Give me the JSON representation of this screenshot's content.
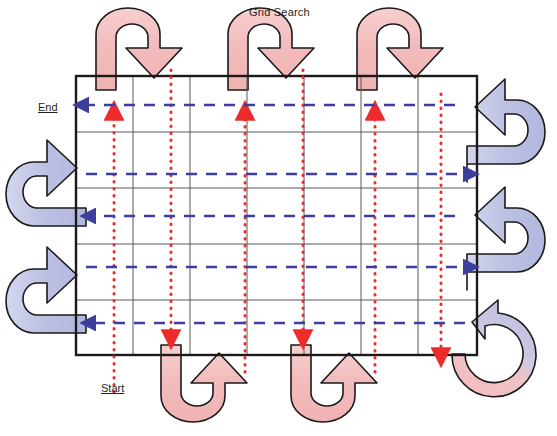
{
  "diagram": {
    "title": "Grid Search",
    "start_label": "Start",
    "end_label": "End",
    "colors": {
      "grid_border": "#1a1a1a",
      "grid_line": "#595959",
      "sweep_path": "#ee2b2b",
      "return_path": "#3d3d9e",
      "turn_arrow_pink": "#f4bdbd",
      "turn_arrow_blue": "#bcc0e2",
      "turn_arrow_outline": "#1a1a1a",
      "background": "#ffffff",
      "text": "#231f20"
    },
    "grid": {
      "left": 76,
      "top": 76,
      "right": 477,
      "bottom": 355,
      "columns": 7,
      "rows": 5,
      "column_x": [
        76,
        133,
        190,
        247,
        304,
        361,
        418,
        477
      ],
      "row_y": [
        76,
        132,
        188,
        244,
        300,
        355
      ]
    },
    "sweep_lines": [
      {
        "name": "sweep-col-1",
        "x": 114,
        "direction": "up"
      },
      {
        "name": "sweep-col-2",
        "x": 171,
        "direction": "down"
      },
      {
        "name": "sweep-col-3",
        "x": 245,
        "direction": "up"
      },
      {
        "name": "sweep-col-4",
        "x": 303,
        "direction": "down"
      },
      {
        "name": "sweep-col-5",
        "x": 375,
        "direction": "up"
      },
      {
        "name": "sweep-col-6",
        "x": 441,
        "direction": "down"
      }
    ],
    "return_lines": [
      {
        "name": "return-row-1",
        "y": 105,
        "direction": "left"
      },
      {
        "name": "return-row-2",
        "y": 174,
        "direction": "right"
      },
      {
        "name": "return-row-3",
        "y": 216,
        "direction": "left"
      },
      {
        "name": "return-row-4",
        "y": 267,
        "direction": "right"
      },
      {
        "name": "return-row-5",
        "y": 323,
        "direction": "left"
      }
    ],
    "turn_arrows": [
      {
        "name": "u-turn-top-1",
        "side": "top",
        "color": "pink"
      },
      {
        "name": "u-turn-top-2",
        "side": "top",
        "color": "pink"
      },
      {
        "name": "u-turn-top-3",
        "side": "top",
        "color": "pink"
      },
      {
        "name": "u-turn-bottom-1",
        "side": "bottom",
        "color": "pink"
      },
      {
        "name": "u-turn-bottom-2",
        "side": "bottom",
        "color": "pink"
      },
      {
        "name": "u-turn-left-1",
        "side": "left",
        "color": "blue"
      },
      {
        "name": "u-turn-left-2",
        "side": "left",
        "color": "blue"
      },
      {
        "name": "u-turn-right-1",
        "side": "right",
        "color": "blue"
      },
      {
        "name": "u-turn-right-2",
        "side": "right",
        "color": "blue"
      },
      {
        "name": "u-turn-corner-bottom-right",
        "side": "corner",
        "color": "pink-blue"
      }
    ]
  }
}
